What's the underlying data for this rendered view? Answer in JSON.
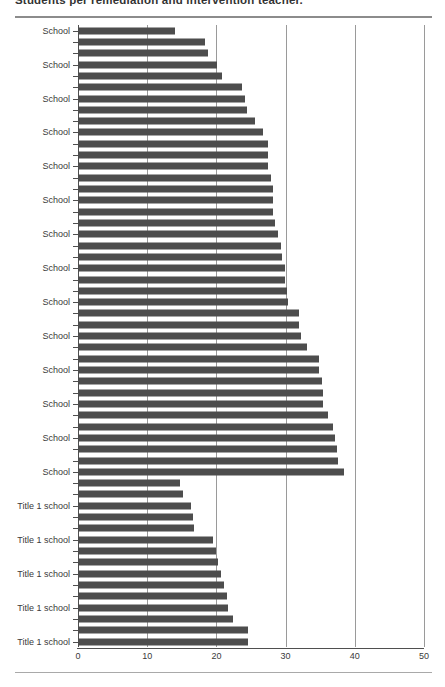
{
  "header": {
    "title": "Students per remediation and intervention teacher."
  },
  "chart_data": {
    "type": "bar",
    "orientation": "horizontal",
    "title": "Students per remediation and intervention teacher.",
    "xlabel": "",
    "ylabel": "",
    "xlim": [
      0,
      50
    ],
    "x_ticks": [
      0,
      10,
      20,
      30,
      40,
      50
    ],
    "grid": true,
    "legend": "none",
    "bar_color": "#4d4d4d",
    "gridline_color": "#9a9a9a",
    "category_label_interval": 3,
    "groups": [
      "School",
      "Title 1 school"
    ],
    "bars": [
      {
        "group": "School",
        "label": "School",
        "value": 14.0
      },
      {
        "group": "School",
        "label": "",
        "value": 18.4
      },
      {
        "group": "School",
        "label": "",
        "value": 18.8
      },
      {
        "group": "School",
        "label": "School",
        "value": 20.1
      },
      {
        "group": "School",
        "label": "",
        "value": 20.8
      },
      {
        "group": "School",
        "label": "",
        "value": 23.7
      },
      {
        "group": "School",
        "label": "School",
        "value": 24.1
      },
      {
        "group": "School",
        "label": "",
        "value": 24.4
      },
      {
        "group": "School",
        "label": "",
        "value": 25.6
      },
      {
        "group": "School",
        "label": "School",
        "value": 26.7
      },
      {
        "group": "School",
        "label": "",
        "value": 27.4
      },
      {
        "group": "School",
        "label": "",
        "value": 27.5
      },
      {
        "group": "School",
        "label": "School",
        "value": 27.5
      },
      {
        "group": "School",
        "label": "",
        "value": 27.9
      },
      {
        "group": "School",
        "label": "",
        "value": 28.2
      },
      {
        "group": "School",
        "label": "School",
        "value": 28.2
      },
      {
        "group": "School",
        "label": "",
        "value": 28.2
      },
      {
        "group": "School",
        "label": "",
        "value": 28.5
      },
      {
        "group": "School",
        "label": "School",
        "value": 28.9
      },
      {
        "group": "School",
        "label": "",
        "value": 29.3
      },
      {
        "group": "School",
        "label": "",
        "value": 29.5
      },
      {
        "group": "School",
        "label": "School",
        "value": 29.9
      },
      {
        "group": "School",
        "label": "",
        "value": 29.9
      },
      {
        "group": "School",
        "label": "",
        "value": 30.2
      },
      {
        "group": "School",
        "label": "School",
        "value": 30.3
      },
      {
        "group": "School",
        "label": "",
        "value": 31.9
      },
      {
        "group": "School",
        "label": "",
        "value": 31.9
      },
      {
        "group": "School",
        "label": "School",
        "value": 32.2
      },
      {
        "group": "School",
        "label": "",
        "value": 33.1
      },
      {
        "group": "School",
        "label": "",
        "value": 34.8
      },
      {
        "group": "School",
        "label": "School",
        "value": 34.8
      },
      {
        "group": "School",
        "label": "",
        "value": 35.2
      },
      {
        "group": "School",
        "label": "",
        "value": 35.4
      },
      {
        "group": "School",
        "label": "School",
        "value": 35.4
      },
      {
        "group": "School",
        "label": "",
        "value": 36.1
      },
      {
        "group": "School",
        "label": "",
        "value": 36.9
      },
      {
        "group": "School",
        "label": "School",
        "value": 37.1
      },
      {
        "group": "School",
        "label": "",
        "value": 37.4
      },
      {
        "group": "School",
        "label": "",
        "value": 37.6
      },
      {
        "group": "School",
        "label": "School",
        "value": 38.4
      },
      {
        "group": "Title 1 school",
        "label": "",
        "value": 14.7
      },
      {
        "group": "Title 1 school",
        "label": "",
        "value": 15.2
      },
      {
        "group": "Title 1 school",
        "label": "Title 1 school",
        "value": 16.3
      },
      {
        "group": "Title 1 school",
        "label": "",
        "value": 16.6
      },
      {
        "group": "Title 1 school",
        "label": "",
        "value": 16.8
      },
      {
        "group": "Title 1 school",
        "label": "Title 1 school",
        "value": 19.5
      },
      {
        "group": "Title 1 school",
        "label": "",
        "value": 19.9
      },
      {
        "group": "Title 1 school",
        "label": "",
        "value": 20.2
      },
      {
        "group": "Title 1 school",
        "label": "Title 1 school",
        "value": 20.7
      },
      {
        "group": "Title 1 school",
        "label": "",
        "value": 21.1
      },
      {
        "group": "Title 1 school",
        "label": "",
        "value": 21.5
      },
      {
        "group": "Title 1 school",
        "label": "Title 1 school",
        "value": 21.7
      },
      {
        "group": "Title 1 school",
        "label": "",
        "value": 22.4
      },
      {
        "group": "Title 1 school",
        "label": "",
        "value": 24.6
      },
      {
        "group": "Title 1 school",
        "label": "Title 1 school",
        "value": 24.6
      }
    ]
  }
}
